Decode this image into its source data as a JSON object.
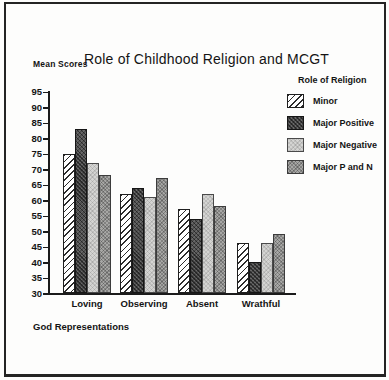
{
  "window": {
    "background": "#fdfdfc",
    "border_color": "#242424"
  },
  "chart": {
    "y_axis_title": "Mean Scores",
    "title": "Role of Childhood Religion and MCGT",
    "x_axis_title": "God Representations",
    "legend_title": "Role of Religion"
  },
  "chart_data": {
    "type": "bar",
    "title": "Role of Childhood Religion and MCGT",
    "xlabel": "God Representations",
    "ylabel": "Mean Scores",
    "categories": [
      "Loving",
      "Observing",
      "Absent",
      "Wrathful"
    ],
    "series": [
      {
        "name": "Minor",
        "pattern": "white-diagonal-hatch",
        "values": [
          75,
          62,
          57,
          46
        ]
      },
      {
        "name": "Major Positive",
        "pattern": "dark-gray-check",
        "values": [
          83,
          64,
          54,
          40
        ]
      },
      {
        "name": "Major Negative",
        "pattern": "light-gray-dot",
        "values": [
          72,
          61,
          62,
          46
        ]
      },
      {
        "name": "Major P and N",
        "pattern": "medium-gray-dot",
        "values": [
          68,
          67,
          58,
          49
        ]
      }
    ],
    "ylim": [
      30,
      95
    ],
    "yticks": [
      30,
      35,
      40,
      45,
      50,
      55,
      60,
      65,
      70,
      75,
      80,
      85,
      90,
      95
    ],
    "grid": false,
    "legend_position": "upper-right",
    "legend_title": "Role of Religion"
  },
  "colors": {
    "axis": "#1b1b1b",
    "series_dark": "#4e4e4e",
    "series_light": "#d4d4d2",
    "series_medium": "#a7a7a5",
    "hatch_line": "#2c2c2c"
  }
}
